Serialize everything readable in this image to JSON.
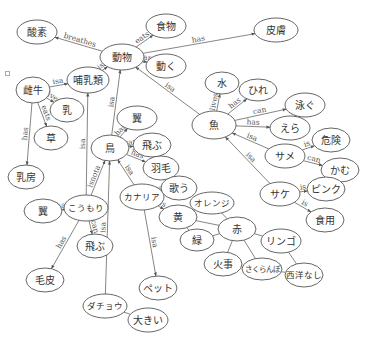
{
  "diagram": {
    "type": "semantic-network",
    "nodes": [
      {
        "id": "sanso",
        "label": "酸素",
        "x": 37,
        "y": 32,
        "rx": 20,
        "ry": 12
      },
      {
        "id": "shokumotsu",
        "label": "食物",
        "x": 166,
        "y": 26,
        "rx": 20,
        "ry": 12
      },
      {
        "id": "doubutsu",
        "label": "動物",
        "x": 122,
        "y": 57,
        "rx": 22,
        "ry": 13
      },
      {
        "id": "ugoku",
        "label": "動く",
        "x": 166,
        "y": 66,
        "rx": 20,
        "ry": 12
      },
      {
        "id": "hifu",
        "label": "皮膚",
        "x": 276,
        "y": 30,
        "rx": 22,
        "ry": 12
      },
      {
        "id": "mesuushi",
        "label": "雌牛",
        "x": 33,
        "y": 90,
        "rx": 17,
        "ry": 13
      },
      {
        "id": "honyurui",
        "label": "哺乳類",
        "x": 88,
        "y": 80,
        "rx": 21,
        "ry": 13
      },
      {
        "id": "chichi",
        "label": "乳",
        "x": 67,
        "y": 110,
        "rx": 17,
        "ry": 12
      },
      {
        "id": "kusa",
        "label": "草",
        "x": 51,
        "y": 138,
        "rx": 17,
        "ry": 12
      },
      {
        "id": "nyuubou",
        "label": "乳房",
        "x": 26,
        "y": 177,
        "rx": 18,
        "ry": 12
      },
      {
        "id": "mizu",
        "label": "水",
        "x": 222,
        "y": 83,
        "rx": 17,
        "ry": 11
      },
      {
        "id": "hire",
        "label": "ひれ",
        "x": 258,
        "y": 90,
        "rx": 19,
        "ry": 11
      },
      {
        "id": "sakana",
        "label": "魚",
        "x": 214,
        "y": 125,
        "rx": 22,
        "ry": 14
      },
      {
        "id": "oyogu",
        "label": "泳ぐ",
        "x": 305,
        "y": 105,
        "rx": 20,
        "ry": 12
      },
      {
        "id": "era",
        "label": "えら",
        "x": 290,
        "y": 128,
        "rx": 20,
        "ry": 12
      },
      {
        "id": "same",
        "label": "サメ",
        "x": 285,
        "y": 156,
        "rx": 20,
        "ry": 12
      },
      {
        "id": "kiken",
        "label": "危険",
        "x": 331,
        "y": 140,
        "rx": 19,
        "ry": 12
      },
      {
        "id": "kamu",
        "label": "かむ",
        "x": 340,
        "y": 170,
        "rx": 19,
        "ry": 12
      },
      {
        "id": "tsubasa1",
        "label": "翼",
        "x": 137,
        "y": 118,
        "rx": 20,
        "ry": 12
      },
      {
        "id": "tori",
        "label": "鳥",
        "x": 110,
        "y": 148,
        "rx": 19,
        "ry": 13
      },
      {
        "id": "tobu1",
        "label": "飛ぶ",
        "x": 152,
        "y": 145,
        "rx": 19,
        "ry": 12
      },
      {
        "id": "hane",
        "label": "羽毛",
        "x": 161,
        "y": 168,
        "rx": 18,
        "ry": 12
      },
      {
        "id": "kanaria",
        "label": "カナリア",
        "x": 142,
        "y": 197,
        "rx": 22,
        "ry": 13
      },
      {
        "id": "utau",
        "label": "歌う",
        "x": 179,
        "y": 188,
        "rx": 18,
        "ry": 12
      },
      {
        "id": "ki",
        "label": "黄",
        "x": 178,
        "y": 217,
        "rx": 19,
        "ry": 12
      },
      {
        "id": "orenji",
        "label": "オレンジ",
        "x": 212,
        "y": 203,
        "rx": 22,
        "ry": 11
      },
      {
        "id": "aka",
        "label": "赤",
        "x": 237,
        "y": 229,
        "rx": 19,
        "ry": 12
      },
      {
        "id": "midori",
        "label": "緑",
        "x": 197,
        "y": 240,
        "rx": 17,
        "ry": 11
      },
      {
        "id": "ringo",
        "label": "リンゴ",
        "x": 281,
        "y": 241,
        "rx": 20,
        "ry": 12
      },
      {
        "id": "kaji",
        "label": "火事",
        "x": 223,
        "y": 264,
        "rx": 19,
        "ry": 12
      },
      {
        "id": "sakuranbo",
        "label": "さくらんぼ",
        "x": 262,
        "y": 269,
        "rx": 20,
        "ry": 11
      },
      {
        "id": "seiyounashi",
        "label": "西洋なし",
        "x": 304,
        "y": 275,
        "rx": 19,
        "ry": 12
      },
      {
        "id": "sake",
        "label": "サケ",
        "x": 280,
        "y": 194,
        "rx": 20,
        "ry": 12
      },
      {
        "id": "pinku",
        "label": "ピンク",
        "x": 326,
        "y": 189,
        "rx": 19,
        "ry": 12
      },
      {
        "id": "shokuyou",
        "label": "食用",
        "x": 325,
        "y": 220,
        "rx": 19,
        "ry": 12
      },
      {
        "id": "tsubasa2",
        "label": "翼",
        "x": 43,
        "y": 211,
        "rx": 19,
        "ry": 12
      },
      {
        "id": "koumori",
        "label": "こうもり",
        "x": 86,
        "y": 208,
        "rx": 22,
        "ry": 13
      },
      {
        "id": "tobu2",
        "label": "飛ぶ",
        "x": 95,
        "y": 246,
        "rx": 18,
        "ry": 12
      },
      {
        "id": "kegawa",
        "label": "毛皮",
        "x": 45,
        "y": 280,
        "rx": 19,
        "ry": 12
      },
      {
        "id": "petto",
        "label": "ペット",
        "x": 158,
        "y": 288,
        "rx": 19,
        "ry": 12
      },
      {
        "id": "dachou",
        "label": "ダチョウ",
        "x": 105,
        "y": 306,
        "rx": 22,
        "ry": 12
      },
      {
        "id": "ookii",
        "label": "大きい",
        "x": 148,
        "y": 320,
        "rx": 20,
        "ry": 12
      }
    ],
    "edges": [
      {
        "from": "doubutsu",
        "to": "sanso",
        "label": "breathes",
        "arrow": true
      },
      {
        "from": "doubutsu",
        "to": "shokumotsu",
        "label": "eats",
        "arrow": true
      },
      {
        "from": "doubutsu",
        "to": "ugoku",
        "label": "can",
        "arrow": true
      },
      {
        "from": "doubutsu",
        "to": "hifu",
        "label": "has",
        "arrow": true
      },
      {
        "from": "honyurui",
        "to": "doubutsu",
        "label": "isa",
        "arrow": true
      },
      {
        "from": "mesuushi",
        "to": "honyurui",
        "label": "isa",
        "arrow": true
      },
      {
        "from": "mesuushi",
        "to": "chichi",
        "label": "gives",
        "arrow": true
      },
      {
        "from": "mesuushi",
        "to": "kusa",
        "label": "eats",
        "arrow": true
      },
      {
        "from": "mesuushi",
        "to": "nyuubou",
        "label": "has",
        "arrow": true
      },
      {
        "from": "tori",
        "to": "doubutsu",
        "label": "isa",
        "arrow": true
      },
      {
        "from": "sakana",
        "to": "doubutsu",
        "label": "isa",
        "arrow": true
      },
      {
        "from": "sakana",
        "to": "mizu",
        "label": "lives",
        "arrow": true
      },
      {
        "from": "sakana",
        "to": "hire",
        "label": "has",
        "arrow": true
      },
      {
        "from": "sakana",
        "to": "oyogu",
        "label": "can",
        "arrow": true
      },
      {
        "from": "sakana",
        "to": "era",
        "label": "has",
        "arrow": true
      },
      {
        "from": "same",
        "to": "sakana",
        "label": "isa",
        "arrow": true
      },
      {
        "from": "same",
        "to": "kiken",
        "label": "is",
        "arrow": true
      },
      {
        "from": "same",
        "to": "kamu",
        "label": "can",
        "arrow": true
      },
      {
        "from": "sake",
        "to": "sakana",
        "label": "isa",
        "arrow": true
      },
      {
        "from": "sake",
        "to": "pinku",
        "label": "is",
        "arrow": true
      },
      {
        "from": "sake",
        "to": "shokuyou",
        "label": "is",
        "arrow": true
      },
      {
        "from": "tori",
        "to": "tsubasa1",
        "label": "has",
        "arrow": true
      },
      {
        "from": "tori",
        "to": "tobu1",
        "label": "can",
        "arrow": true
      },
      {
        "from": "tori",
        "to": "hane",
        "label": "has",
        "arrow": true
      },
      {
        "from": "kanaria",
        "to": "tori",
        "label": "isa",
        "arrow": true
      },
      {
        "from": "kanaria",
        "to": "utau",
        "label": "can",
        "arrow": true
      },
      {
        "from": "kanaria",
        "to": "ki",
        "label": "is",
        "arrow": true
      },
      {
        "from": "kanaria",
        "to": "petto",
        "label": "isa",
        "arrow": true
      },
      {
        "from": "koumori",
        "to": "tori",
        "label": "isnota",
        "arrow": true
      },
      {
        "from": "koumori",
        "to": "honyurui",
        "label": "isa",
        "arrow": true
      },
      {
        "from": "koumori",
        "to": "tsubasa2",
        "label": "has",
        "arrow": true
      },
      {
        "from": "koumori",
        "to": "tobu2",
        "label": "can",
        "arrow": true
      },
      {
        "from": "koumori",
        "to": "kegawa",
        "label": "has",
        "arrow": true
      },
      {
        "from": "dachou",
        "to": "tori",
        "label": "isa",
        "arrow": true
      },
      {
        "from": "dachou",
        "to": "ookii",
        "label": "",
        "arrow": false
      },
      {
        "from": "ki",
        "to": "orenji",
        "label": "",
        "arrow": false
      },
      {
        "from": "ki",
        "to": "aka",
        "label": "",
        "arrow": false
      },
      {
        "from": "ki",
        "to": "midori",
        "label": "",
        "arrow": false
      },
      {
        "from": "orenji",
        "to": "aka",
        "label": "",
        "arrow": false
      },
      {
        "from": "midori",
        "to": "aka",
        "label": "",
        "arrow": false
      },
      {
        "from": "aka",
        "to": "ringo",
        "label": "",
        "arrow": false
      },
      {
        "from": "aka",
        "to": "kaji",
        "label": "",
        "arrow": false
      },
      {
        "from": "aka",
        "to": "sakuranbo",
        "label": "",
        "arrow": false
      },
      {
        "from": "ringo",
        "to": "seiyounashi",
        "label": "",
        "arrow": false
      },
      {
        "from": "sakuranbo",
        "to": "seiyounashi",
        "label": "",
        "arrow": false
      }
    ]
  }
}
